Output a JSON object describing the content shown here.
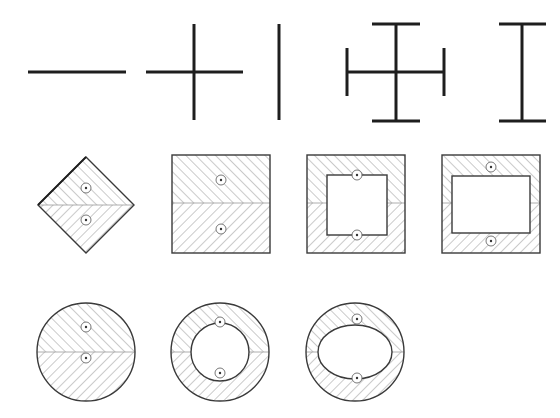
{
  "figure": {
    "background": "#ffffff",
    "line_color": "#1e1e1e",
    "hatch_color": "#8a8a8a",
    "rows": [
      {
        "name": "line-symbols",
        "items": [
          {
            "id": "horizontal-line",
            "label": ""
          },
          {
            "id": "plus-cross",
            "label": ""
          },
          {
            "id": "vertical-line",
            "label": ""
          },
          {
            "id": "cross-with-end-caps",
            "label": ""
          },
          {
            "id": "i-beam",
            "label": ""
          }
        ]
      },
      {
        "name": "rectangular-sections",
        "items": [
          {
            "id": "diamond-section",
            "hatched": true,
            "markers": 2
          },
          {
            "id": "solid-square-section",
            "hatched": true,
            "markers": 2
          },
          {
            "id": "hollow-square-section",
            "hatched": true,
            "markers": 2
          },
          {
            "id": "hollow-rectangular-section",
            "hatched": true,
            "markers": 2
          }
        ]
      },
      {
        "name": "circular-sections",
        "items": [
          {
            "id": "solid-circle-section",
            "hatched": true,
            "markers": 2
          },
          {
            "id": "annular-section",
            "hatched": true,
            "markers": 2
          },
          {
            "id": "elliptical-hole-section",
            "hatched": true,
            "markers": 2
          }
        ]
      }
    ]
  }
}
